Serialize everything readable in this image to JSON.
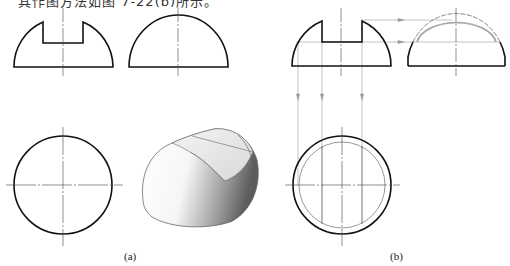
{
  "caption_top": "其作图方法如图 7-22(b)所示。",
  "figures": {
    "a": {
      "label": "(a)",
      "views": [
        "front-view-slotted-hemisphere",
        "side-view-hemisphere",
        "top-view-circle",
        "3d-rendering-slotted-hemisphere"
      ]
    },
    "b": {
      "label": "(b)",
      "views": [
        "front-view-with-projection-lines",
        "side-view-with-inner-arc",
        "top-view-with-slot-lines"
      ]
    }
  },
  "colors": {
    "outline": "#111111",
    "centerline": "#444444",
    "construction": "#9a9a9a",
    "shade_dark": "#6e6e6e",
    "shade_light": "#f2f2f2"
  }
}
